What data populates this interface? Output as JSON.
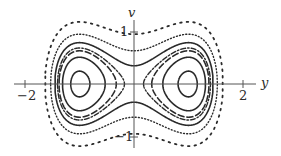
{
  "diagram": {
    "type": "phase_portrait",
    "system": "v^2/2 - y^2/2 + y^4/4 = E",
    "axes": {
      "horizontal_label": "y",
      "vertical_label": "v",
      "x_ticks": [
        {
          "value": -2,
          "label": "−2"
        },
        {
          "value": 2,
          "label": "2"
        }
      ],
      "y_ticks": [
        {
          "value": 1,
          "label": "1"
        },
        {
          "value": -1,
          "label": "−1"
        }
      ],
      "xlim": [
        -2.4,
        2.7
      ],
      "ylim": [
        -1.35,
        1.5
      ]
    },
    "equilibria": [
      {
        "y": -1,
        "v": 0,
        "kind": "center"
      },
      {
        "y": 1,
        "v": 0,
        "kind": "center"
      },
      {
        "y": 0,
        "v": 0,
        "kind": "saddle"
      }
    ],
    "level_curves": [
      {
        "energy": -0.22,
        "style": "solid"
      },
      {
        "energy": -0.12,
        "style": "solid"
      },
      {
        "energy": -0.05,
        "style": "dashed"
      },
      {
        "energy": -0.015,
        "style": "dash-dot"
      },
      {
        "energy": 0.06,
        "style": "solid"
      },
      {
        "energy": 0.2,
        "style": "dotted"
      },
      {
        "energy": 0.45,
        "style": "sparse-dotted"
      }
    ],
    "colors": {
      "ink": "#2a2a2a",
      "axis": "#555555"
    }
  }
}
